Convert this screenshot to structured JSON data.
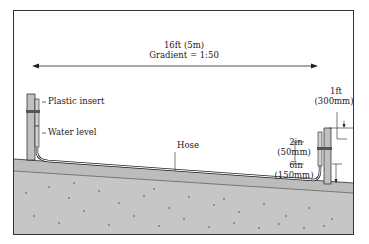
{
  "diagram": {
    "title_distance": "16ft (5m)",
    "title_gradient": "Gradient = 1:50",
    "labels": {
      "plastic_insert": "Plastic insert",
      "water_level": "Water level",
      "hose": "Hose",
      "right_top_1": "1ft",
      "right_top_2": "(300mm)",
      "mid_1": "2in",
      "mid_2": "(50mm)",
      "low_1": "6in",
      "low_2": "(150mm)"
    },
    "colors": {
      "ground": "#bdbdbd",
      "soil": "#c8c8c8",
      "post": "#c0c0c0",
      "line": "#222222"
    }
  }
}
